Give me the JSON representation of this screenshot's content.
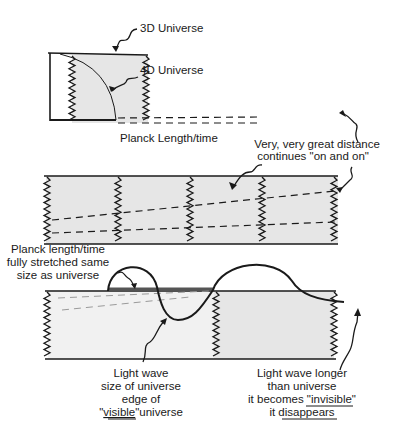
{
  "diagram": {
    "colors": {
      "ink": "#1a1a1a",
      "fill": "#e6e6e6",
      "dash_light": "#9a9a9a"
    },
    "panel1": {
      "label_3d": "3D Universe",
      "label_4d": "4D Universe",
      "label_planck": "Planck Length/time",
      "label_distance": "Very, very great distance"
    },
    "panel2": {
      "label_continues": "continues \"on and on\""
    },
    "panel3": {
      "label_stretched": [
        "Planck length/time",
        "fully stretched same",
        "size as universe"
      ],
      "label_light_wave_edge": [
        "Light wave",
        "size of universe",
        "edge of"
      ],
      "label_visible_pre": "\"",
      "label_visible": "visible",
      "label_visible_post": "\"universe",
      "label_longer": [
        "Light wave longer",
        "than universe"
      ],
      "label_becomes_pre": "it becomes ",
      "label_invisible": "\"invisible\"",
      "label_disappears_pre": "it ",
      "label_disappears": "disappears"
    }
  }
}
